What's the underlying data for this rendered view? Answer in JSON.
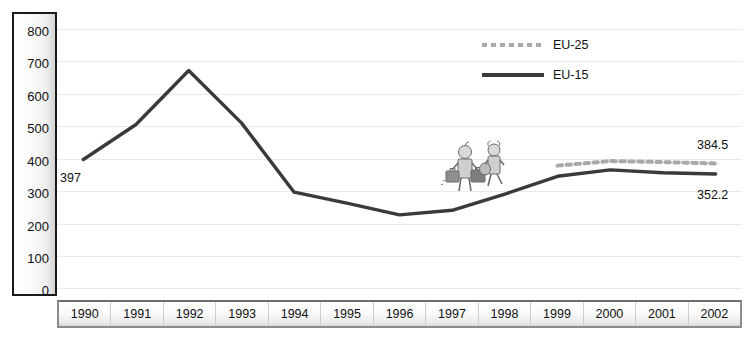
{
  "chart_data": {
    "type": "line",
    "title": "",
    "xlabel": "",
    "ylabel": "",
    "ylim": [
      0,
      800
    ],
    "ytick_step": 100,
    "grid": true,
    "legend_position": "top-right",
    "categories": [
      "1990",
      "1991",
      "1992",
      "1993",
      "1994",
      "1995",
      "1996",
      "1997",
      "1998",
      "1999",
      "2000",
      "2001",
      "2002"
    ],
    "yticks": [
      "800",
      "700",
      "600",
      "500",
      "400",
      "300",
      "200",
      "100",
      "0"
    ],
    "series": [
      {
        "name": "EU-25",
        "style": "dashed",
        "color": "#a9a9a9",
        "x": [
          "1999",
          "2000",
          "2001",
          "2002"
        ],
        "values": [
          378,
          392,
          389,
          384.5
        ],
        "end_label": "384.5"
      },
      {
        "name": "EU-15",
        "style": "solid",
        "color": "#3a3a3a",
        "x": [
          "1990",
          "1991",
          "1992",
          "1993",
          "1994",
          "1995",
          "1996",
          "1997",
          "1998",
          "1999",
          "2000",
          "2001",
          "2002"
        ],
        "values": [
          397,
          505,
          672,
          510,
          296,
          262,
          226,
          240,
          290,
          345,
          365,
          356,
          352.2
        ],
        "start_label": "397",
        "end_label": "352.2"
      }
    ],
    "annotations": [
      {
        "name": "start-value",
        "text": "397",
        "at": "1990"
      },
      {
        "name": "eu25-end-value",
        "text": "384.5",
        "at": "2002"
      },
      {
        "name": "eu15-end-value",
        "text": "352.2",
        "at": "2002"
      }
    ]
  },
  "legend": {
    "items": [
      {
        "label": "EU-25",
        "style": "dashed"
      },
      {
        "label": "EU-15",
        "style": "solid"
      }
    ]
  },
  "decorations": {
    "clipart_name": "two-travellers-with-luggage-illustration"
  }
}
